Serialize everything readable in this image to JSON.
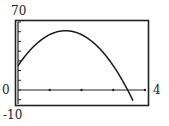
{
  "labels": {
    "ymax": "70",
    "ymin": "-10",
    "xmin": "0",
    "xmax": "4"
  },
  "colors": {
    "frame": "#222222",
    "curve": "#1a1a1a",
    "background": "#ffffff"
  },
  "chart_data": {
    "type": "line",
    "title": "",
    "xlabel": "",
    "ylabel": "",
    "xlim": [
      0,
      4
    ],
    "ylim": [
      -10,
      70
    ],
    "x_tick_step": 1,
    "y_tick_step": 10,
    "grid": false,
    "legend": null,
    "series": [
      {
        "name": "y = -16x^2 + 48x + 25",
        "x": [
          0,
          0.5,
          1,
          1.5,
          2,
          2.5,
          3,
          3.45,
          3.6
        ],
        "values": [
          25,
          45,
          57,
          61,
          57,
          45,
          25,
          0,
          -9
        ]
      }
    ]
  }
}
